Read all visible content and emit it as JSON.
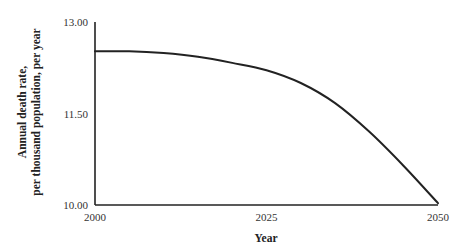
{
  "chart_data": {
    "type": "line",
    "title": "",
    "xlabel": "Year",
    "ylabel_lines": [
      "Annual death rate,",
      "per thousand population, per year"
    ],
    "xlim": [
      2000,
      2050
    ],
    "ylim": [
      10.0,
      13.0
    ],
    "x_ticks": [
      {
        "value": 2000,
        "label": "2000"
      },
      {
        "value": 2025,
        "label": "2025"
      },
      {
        "value": 2050,
        "label": "2050"
      }
    ],
    "y_ticks": [
      {
        "value": 10.0,
        "label": "10.00"
      },
      {
        "value": 11.5,
        "label": "11.50"
      },
      {
        "value": 13.0,
        "label": "13.00"
      }
    ],
    "grid": false,
    "legend": "none",
    "series": [
      {
        "name": "Annual death rate",
        "color": "#222222",
        "x": [
          2000,
          2005,
          2010,
          2015,
          2020,
          2025,
          2030,
          2035,
          2040,
          2045,
          2050
        ],
        "y": [
          12.52,
          12.52,
          12.49,
          12.43,
          12.33,
          12.21,
          12.0,
          11.67,
          11.2,
          10.64,
          10.03
        ]
      }
    ]
  }
}
